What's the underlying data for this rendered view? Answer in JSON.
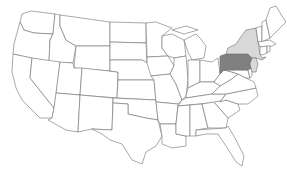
{
  "map": {
    "title": "United States map with highlighted states",
    "colors": {
      "background": "#ffffff",
      "default_fill": "#ffffff",
      "border": "#6e6e6e",
      "primary_highlight": "#808080",
      "secondary_highlight": "#d9d9d9"
    },
    "highlighted": {
      "primary": [
        "Pennsylvania"
      ],
      "secondary": [
        "New York",
        "New Jersey"
      ]
    }
  }
}
